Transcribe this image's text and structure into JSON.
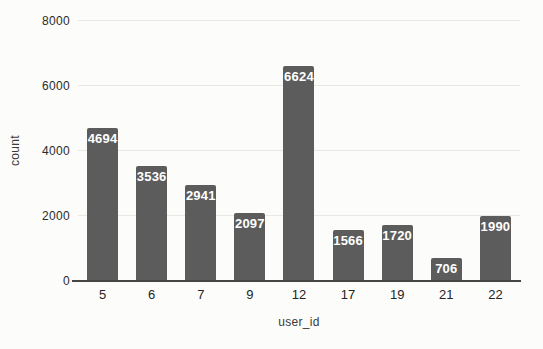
{
  "chart_data": {
    "type": "bar",
    "categories": [
      "5",
      "6",
      "7",
      "9",
      "12",
      "17",
      "19",
      "21",
      "22"
    ],
    "values": [
      4694,
      3536,
      2941,
      2097,
      6624,
      1566,
      1720,
      706,
      1990
    ],
    "title": "",
    "xlabel": "user_id",
    "ylabel": "count",
    "ylim": [
      0,
      8000
    ],
    "yticks": [
      0,
      2000,
      4000,
      6000,
      8000
    ],
    "grid": true,
    "legend": null,
    "bar_color": "#5c5c5c",
    "value_label_color": "#ffffff",
    "gridline_color": "#e8e8e4",
    "axis_line_color": "#454545",
    "background_color": "#fcfcfa"
  }
}
